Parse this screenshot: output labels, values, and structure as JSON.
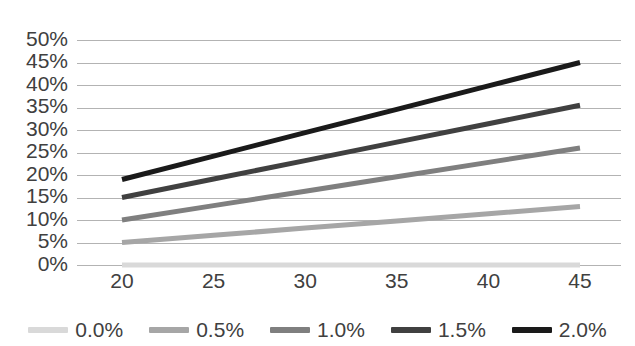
{
  "chart_data": {
    "type": "line",
    "title": "",
    "xlabel": "",
    "ylabel": "",
    "x": [
      20,
      25,
      30,
      35,
      40,
      45
    ],
    "xlim": [
      20,
      45
    ],
    "ylim": [
      0,
      50
    ],
    "ytick_labels": [
      "50%",
      "45%",
      "40%",
      "35%",
      "30%",
      "25%",
      "20%",
      "15%",
      "10%",
      "5%",
      "0%"
    ],
    "ytick_values": [
      50,
      45,
      40,
      35,
      30,
      25,
      20,
      15,
      10,
      5,
      0
    ],
    "xtick_labels": [
      "20",
      "25",
      "30",
      "35",
      "40",
      "45"
    ],
    "grid": "horizontal",
    "legend_position": "bottom",
    "series": [
      {
        "name": "0.0%",
        "color": "#d9d9d9",
        "width": 5,
        "values": [
          0.0,
          0.0,
          0.0,
          0.0,
          0.0,
          0.0
        ]
      },
      {
        "name": "0.5%",
        "color": "#a6a6a6",
        "width": 5,
        "values": [
          5.0,
          6.6,
          8.2,
          9.8,
          11.4,
          13.0
        ]
      },
      {
        "name": "1.0%",
        "color": "#7f7f7f",
        "width": 5,
        "values": [
          10.0,
          13.2,
          16.4,
          19.6,
          22.8,
          26.0
        ]
      },
      {
        "name": "1.5%",
        "color": "#404040",
        "width": 5,
        "values": [
          15.0,
          19.1,
          23.2,
          27.3,
          31.4,
          35.5
        ]
      },
      {
        "name": "2.0%",
        "color": "#1a1a1a",
        "width": 5,
        "values": [
          19.0,
          24.2,
          29.4,
          34.6,
          39.8,
          45.0
        ]
      }
    ]
  },
  "legend": {
    "items": [
      {
        "label": "0.0%"
      },
      {
        "label": "0.5%"
      },
      {
        "label": "1.0%"
      },
      {
        "label": "1.5%"
      },
      {
        "label": "2.0%"
      }
    ]
  }
}
